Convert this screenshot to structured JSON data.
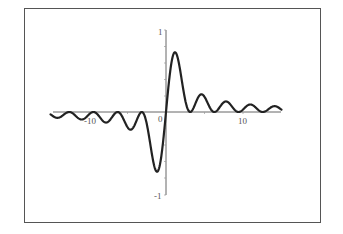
{
  "chart_data": {
    "type": "line",
    "title": "",
    "xlabel": "",
    "ylabel": "",
    "function_hint": "sin(x)^2 / x",
    "xlim": [
      -15,
      15
    ],
    "ylim": [
      -1,
      1
    ],
    "grid": false,
    "legend": null,
    "x_ticks": [
      {
        "value": -10,
        "label": "-10"
      },
      {
        "value": 0,
        "label": "0"
      },
      {
        "value": 10,
        "label": "10"
      }
    ],
    "y_ticks": [
      {
        "value": 1,
        "label": "1"
      },
      {
        "value": -1,
        "label": "-1"
      }
    ],
    "series": [
      {
        "name": "f(x)",
        "color": "#222222",
        "x": [
          -15,
          -14,
          -13,
          -12,
          -11,
          -10,
          -9,
          -8,
          -7,
          -6,
          -5,
          -4,
          -3,
          -2,
          -1.5,
          -1.17,
          -0.8,
          -0.5,
          0,
          0.5,
          0.8,
          1.17,
          1.5,
          2,
          3,
          4,
          5,
          6,
          7,
          8,
          9,
          10,
          11,
          12,
          13,
          14,
          15
        ],
        "y": [
          -0.028,
          -0.07,
          -0.013,
          -0.024,
          -0.091,
          -0.03,
          -0.019,
          -0.122,
          -0.062,
          -0.013,
          -0.184,
          -0.143,
          -0.007,
          -0.413,
          -0.663,
          -0.725,
          -0.644,
          -0.46,
          0,
          0.46,
          0.644,
          0.725,
          0.663,
          0.413,
          0.007,
          0.143,
          0.184,
          0.013,
          0.062,
          0.122,
          0.019,
          0.03,
          0.091,
          0.024,
          0.013,
          0.07,
          0.028
        ]
      }
    ]
  },
  "labels": {
    "y_top": "1",
    "y_bottom": "-1",
    "x_neg": "-10",
    "x_zero": "0",
    "x_pos": "10"
  },
  "style": {
    "line_color": "#222222",
    "axis_color": "#666666",
    "frame_color": "#555555"
  }
}
